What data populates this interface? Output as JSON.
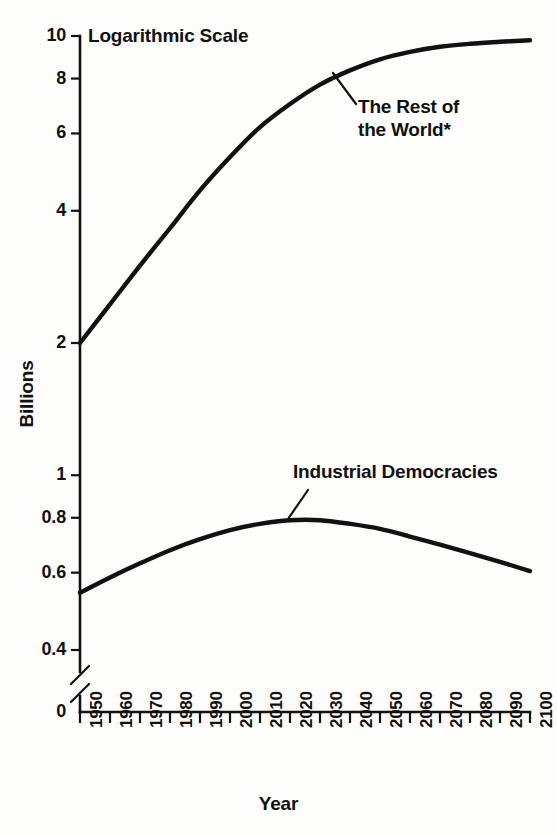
{
  "chart_data": {
    "type": "line",
    "title": "",
    "scale_note": "Logarithmic Scale",
    "xlabel": "Year",
    "ylabel": "Billions",
    "yscale": "log",
    "ylim": [
      0.36,
      10.6
    ],
    "xlim": [
      1950,
      2100
    ],
    "grid": false,
    "legend_position": "inline-annotations",
    "axis_break": true,
    "axis_break_note": "y-axis broken between 0.4 and 0",
    "y_ticks": [
      "10",
      "8",
      "6",
      "4",
      "2",
      "1",
      "0.8",
      "0.6",
      "0.4",
      "0"
    ],
    "y_tick_values": [
      10,
      8,
      6,
      4,
      2,
      1,
      0.8,
      0.6,
      0.4,
      0
    ],
    "x_ticks": [
      "1950",
      "1960",
      "1970",
      "1980",
      "1990",
      "2000",
      "2010",
      "2020",
      "2030",
      "2040",
      "2050",
      "2060",
      "2070",
      "2080",
      "2090",
      "2100"
    ],
    "x": [
      1950,
      1960,
      1970,
      1980,
      1990,
      2000,
      2010,
      2020,
      2030,
      2040,
      2050,
      2060,
      2070,
      2080,
      2090,
      2100
    ],
    "series": [
      {
        "name": "The Rest of the World*",
        "label": "The Rest of\nthe World*",
        "color": "#111111",
        "values": [
          2.0,
          2.45,
          3.0,
          3.65,
          4.45,
          5.3,
          6.2,
          7.0,
          7.75,
          8.35,
          8.85,
          9.2,
          9.45,
          9.6,
          9.7,
          9.78
        ]
      },
      {
        "name": "Industrial Democracies",
        "label": "Industrial Democracies",
        "color": "#111111",
        "values": [
          0.54,
          0.585,
          0.63,
          0.675,
          0.715,
          0.75,
          0.775,
          0.79,
          0.79,
          0.775,
          0.755,
          0.725,
          0.695,
          0.665,
          0.635,
          0.605
        ]
      }
    ]
  },
  "annotations": {
    "scale_note": "Logarithmic Scale",
    "rest_of_world": "The Rest of\nthe World*",
    "industrial_democracies": "Industrial Democracies"
  },
  "axes": {
    "x_title": "Year",
    "y_title": "Billions"
  },
  "colors": {
    "ink": "#111111",
    "background": "#fdfdfc"
  }
}
